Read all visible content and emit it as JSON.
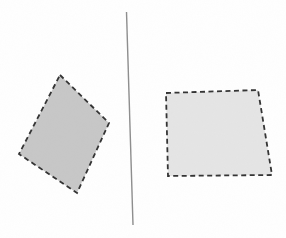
{
  "figure": {
    "background_color": "#ffffff",
    "canvas": {
      "width": 286,
      "height": 238
    },
    "divider_line": {
      "name": "divider-line",
      "x1": 126.5,
      "y1": 12,
      "x2": 133,
      "y2": 225,
      "color": "#8d8d8d",
      "stroke_width": 1.4
    },
    "shapes": [
      {
        "name": "left-quadrilateral",
        "points": "60,75 109,123 77,193 19,154",
        "fill": "#c7c7c7",
        "stroke": "#323232",
        "stroke_width": 1.8,
        "dash": "5 3.5"
      },
      {
        "name": "right-quadrilateral",
        "points": "166,93 258,90 272,175 168,176",
        "fill": "#e5e5e5",
        "stroke": "#323232",
        "stroke_width": 1.8,
        "dash": "5 3.5"
      }
    ],
    "grain_opacity": 0.04
  }
}
